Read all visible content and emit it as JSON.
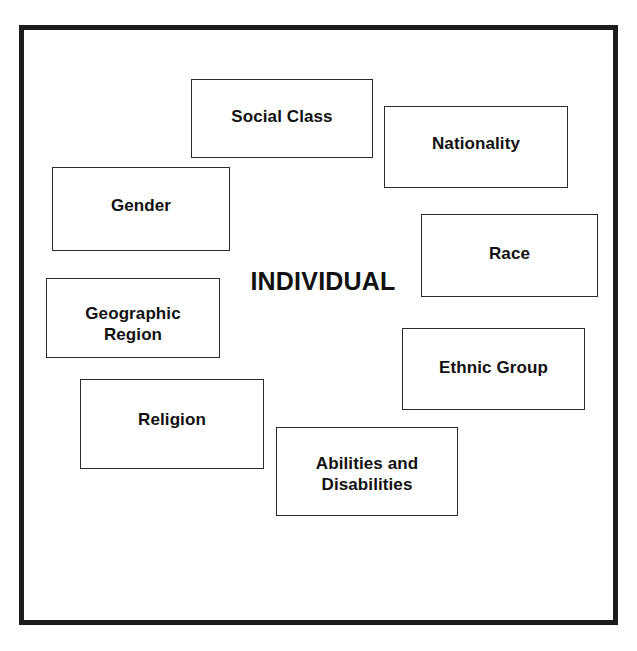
{
  "diagram": {
    "center_label": "INDIVIDUAL",
    "nodes": [
      {
        "id": "social-class",
        "label": "Social Class",
        "x": 191,
        "y": 79,
        "w": 182,
        "h": 79
      },
      {
        "id": "nationality",
        "label": "Nationality",
        "x": 384,
        "y": 106,
        "w": 184,
        "h": 82
      },
      {
        "id": "gender",
        "label": "Gender",
        "x": 52,
        "y": 167,
        "w": 178,
        "h": 84
      },
      {
        "id": "race",
        "label": "Race",
        "x": 421,
        "y": 214,
        "w": 177,
        "h": 83
      },
      {
        "id": "geographic",
        "label": "Geographic\nRegion",
        "x": 46,
        "y": 278,
        "w": 174,
        "h": 80
      },
      {
        "id": "ethnic",
        "label": "Ethnic Group",
        "x": 402,
        "y": 328,
        "w": 183,
        "h": 82
      },
      {
        "id": "religion",
        "label": "Religion",
        "x": 80,
        "y": 379,
        "w": 184,
        "h": 90
      },
      {
        "id": "abilities",
        "label": "Abilities and\nDisabilities",
        "x": 276,
        "y": 427,
        "w": 182,
        "h": 89
      }
    ]
  },
  "colors": {
    "frame": "#1c1c1c",
    "box_border": "#2b2b2b",
    "text": "#111111",
    "background": "#ffffff"
  }
}
